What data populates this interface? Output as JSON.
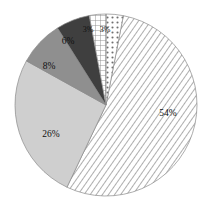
{
  "chart_data": {
    "type": "pie",
    "title": "",
    "subtitle": "",
    "xlabel": "",
    "ylabel": "",
    "legend_position": "none",
    "grid": false,
    "categories": [
      "54%",
      "26%",
      "8%",
      "6%",
      "3%",
      "3%"
    ],
    "values": [
      54,
      26,
      8,
      6,
      3,
      3
    ],
    "labels": [
      "54%",
      "26%",
      "8%",
      "6%",
      "3%",
      "3%"
    ],
    "total": 100,
    "units": "percent",
    "slices": [
      {
        "label": "54%",
        "value": 54,
        "fill_style": "diagonal-hatch",
        "color": "#e8e8e8",
        "pattern_color": "#9a9a9a",
        "start_angle_deg": 11,
        "end_angle_deg": 205.4,
        "label_x": 168,
        "label_y": 114
      },
      {
        "label": "26%",
        "value": 26,
        "fill_style": "solid-light-gray",
        "color": "#cfcfcf",
        "pattern_color": "#cfcfcf",
        "start_angle_deg": 205.4,
        "end_angle_deg": 299,
        "label_x": 51,
        "label_y": 135
      },
      {
        "label": "8%",
        "value": 8,
        "fill_style": "solid-medium-gray",
        "color": "#8f8f8f",
        "pattern_color": "#8f8f8f",
        "start_angle_deg": 299,
        "end_angle_deg": 327.8,
        "label_x": 49,
        "label_y": 67
      },
      {
        "label": "6%",
        "value": 6,
        "fill_style": "solid-dark-gray",
        "color": "#3f3f3f",
        "pattern_color": "#3f3f3f",
        "start_angle_deg": 327.8,
        "end_angle_deg": 349.4,
        "label_x": 68,
        "label_y": 42
      },
      {
        "label": "3%",
        "value": 3,
        "fill_style": "crosshatch-grid",
        "color": "#ffffff",
        "pattern_color": "#8a8a8a",
        "start_angle_deg": 349.4,
        "end_angle_deg": 360.2,
        "label_x": 88,
        "label_y": 30
      },
      {
        "label": "3%",
        "value": 3,
        "fill_style": "dotted-stipple",
        "color": "#ffffff",
        "pattern_color": "#6f6f6f",
        "start_angle_deg": 360.2,
        "end_angle_deg": 371,
        "label_x": 105,
        "label_y": 30
      }
    ],
    "geometry": {
      "center_x": 106,
      "center_y": 105,
      "radius": 91,
      "rotation_note": "first slice begins just past 12 o'clock, sweeping clockwise"
    }
  },
  "figure": {
    "background": "#ffffff",
    "outline_color": "#8a8a8a"
  }
}
